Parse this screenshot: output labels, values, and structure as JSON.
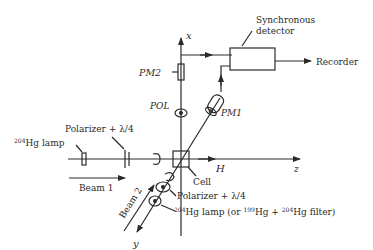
{
  "diagram": {
    "axes": {
      "x": "x",
      "y": "y",
      "z": "z",
      "field": "H"
    },
    "components": {
      "synchronous_detector": [
        "Synchronous",
        "detector"
      ],
      "recorder": "Recorder",
      "pm2": "PM2",
      "pm1": "PM1",
      "pol": "POL",
      "cell": "Cell",
      "lamp1": {
        "sup": "204",
        "text": "Hg lamp"
      },
      "polarizer1": "Polarizer + λ/4",
      "beam1": "Beam 1",
      "beam2": "Beam 2",
      "polarizer2": "Polarizer + λ/4",
      "lamp2": {
        "sup1": "204",
        "text1": "Hg lamp (or ",
        "sup2": "199",
        "text2": "Hg + ",
        "sup3": "204",
        "text3": "Hg filter)"
      }
    },
    "colors": {
      "ink": "#2a2a2a",
      "background": "#ffffff"
    }
  }
}
